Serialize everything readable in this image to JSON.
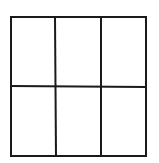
{
  "figure": {
    "type": "grid",
    "rows": 2,
    "columns": 3,
    "cell_count": 6,
    "line_color": "#1a1a1a",
    "background_color": "#ffffff",
    "stroke_width": 2
  }
}
